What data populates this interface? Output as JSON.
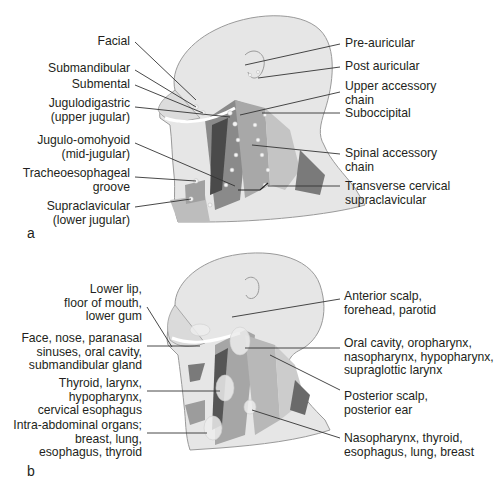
{
  "figure": {
    "panel_a": {
      "letter": "a",
      "left_labels": [
        {
          "lines": [
            "Facial"
          ]
        },
        {
          "lines": [
            "Submandibular"
          ]
        },
        {
          "lines": [
            "Submental"
          ]
        },
        {
          "lines": [
            "Jugulodigastric",
            "(upper jugular)"
          ]
        },
        {
          "lines": [
            "Jugulo-omohyoid",
            "(mid-jugular)"
          ]
        },
        {
          "lines": [
            "Tracheoesophageal",
            "groove"
          ]
        },
        {
          "lines": [
            "Supraclavicular",
            "(lower jugular)"
          ]
        }
      ],
      "right_labels": [
        {
          "lines": [
            "Pre-auricular"
          ]
        },
        {
          "lines": [
            "Post auricular"
          ]
        },
        {
          "lines": [
            "Upper accessory",
            "chain"
          ]
        },
        {
          "lines": [
            "Suboccipital"
          ]
        },
        {
          "lines": [
            "Spinal accessory",
            "chain"
          ]
        },
        {
          "lines": [
            "Transverse cervical",
            "supraclavicular"
          ]
        }
      ]
    },
    "panel_b": {
      "letter": "b",
      "left_labels": [
        {
          "lines": [
            "Lower lip,",
            "floor of mouth,",
            "lower gum"
          ]
        },
        {
          "lines": [
            "Face, nose, paranasal",
            "sinuses, oral cavity,",
            "submandibular gland"
          ]
        },
        {
          "lines": [
            "Thyroid, larynx,",
            "hypopharynx,",
            "cervical esophagus"
          ]
        },
        {
          "lines": [
            "Intra-abdominal organs;",
            "breast, lung,",
            "esophagus, thyroid"
          ]
        }
      ],
      "right_labels": [
        {
          "lines": [
            "Anterior scalp,",
            "forehead, parotid"
          ]
        },
        {
          "lines": [
            "Oral cavity, oropharynx,",
            "nasopharynx, hypopharynx,",
            "supraglottic larynx"
          ]
        },
        {
          "lines": [
            "Posterior scalp,",
            "posterior ear"
          ]
        },
        {
          "lines": [
            "Nasopharynx, thyroid,",
            "esophagus, lung, breast"
          ]
        }
      ]
    },
    "colors": {
      "skin": "#e4e4e4",
      "outline": "#9a9a9a",
      "muscle_dark": "#5a5a5a",
      "muscle_mid": "#8c8c8c",
      "node": "#f4f4f4",
      "leader": "#333333",
      "text": "#231f20"
    }
  }
}
